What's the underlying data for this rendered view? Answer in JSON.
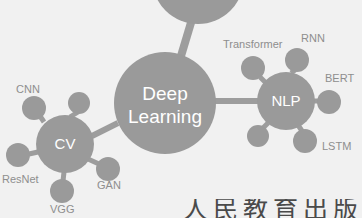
{
  "diagram": {
    "type": "node-link-graph",
    "background_color": "#f1f1f1",
    "node_color": "#9a9a9a",
    "node_label_color": "#ffffff",
    "leaf_label_color": "#8e8e8e",
    "edge_color": "#9d9d9d",
    "root": {
      "name": "partial-node-top",
      "label": "",
      "cx": 198,
      "cy": -22,
      "r": 46,
      "clipped": true
    },
    "hubs": [
      {
        "id": "deep-learning",
        "label_line1": "Deep",
        "label_line2": "Learning",
        "cx": 165,
        "cy": 103,
        "r": 51
      },
      {
        "id": "cv",
        "label_line1": "CV",
        "label_line2": "",
        "cx": 65,
        "cy": 144,
        "r": 29
      },
      {
        "id": "nlp",
        "label_line1": "NLP",
        "label_line2": "",
        "cx": 286,
        "cy": 101,
        "r": 29
      }
    ],
    "leaves": [
      {
        "id": "cnn",
        "label": "CNN",
        "parent": "cv",
        "cx": 34,
        "cy": 108,
        "r": 12,
        "lx": 16,
        "ly": 90,
        "anchor": "start"
      },
      {
        "id": "cv-top",
        "label": "",
        "parent": "cv",
        "cx": 79,
        "cy": 103,
        "r": 11,
        "lx": 0,
        "ly": 0,
        "anchor": "start"
      },
      {
        "id": "resnet",
        "label": "ResNet",
        "parent": "cv",
        "cx": 18,
        "cy": 155,
        "r": 12,
        "lx": 2,
        "ly": 180,
        "anchor": "start"
      },
      {
        "id": "vgg",
        "label": "VGG",
        "parent": "cv",
        "cx": 62,
        "cy": 191,
        "r": 12,
        "lx": 50,
        "ly": 210,
        "anchor": "start"
      },
      {
        "id": "gan",
        "label": "GAN",
        "parent": "cv",
        "cx": 108,
        "cy": 169,
        "r": 12,
        "lx": 97,
        "ly": 186,
        "anchor": "start"
      },
      {
        "id": "transformer",
        "label": "Transformer",
        "parent": "nlp",
        "cx": 253,
        "cy": 68,
        "r": 12,
        "lx": 223,
        "ly": 45,
        "anchor": "start"
      },
      {
        "id": "rnn",
        "label": "RNN",
        "parent": "nlp",
        "cx": 297,
        "cy": 60,
        "r": 12,
        "lx": 301,
        "ly": 39,
        "anchor": "start"
      },
      {
        "id": "bert",
        "label": "BERT",
        "parent": "nlp",
        "cx": 329,
        "cy": 102,
        "r": 12,
        "lx": 325,
        "ly": 79,
        "anchor": "start"
      },
      {
        "id": "lstm",
        "label": "LSTM",
        "parent": "nlp",
        "cx": 305,
        "cy": 141,
        "r": 12,
        "lx": 322,
        "ly": 147,
        "anchor": "start"
      },
      {
        "id": "nlp-bottom",
        "label": "",
        "parent": "nlp",
        "cx": 258,
        "cy": 136,
        "r": 11,
        "lx": 0,
        "ly": 0,
        "anchor": "start"
      }
    ],
    "edges": [
      {
        "id": "edge-root-dl",
        "x1": 193,
        "y1": 16,
        "x2": 181,
        "y2": 56,
        "width": 8
      },
      {
        "id": "edge-dl-cv",
        "x1": 118,
        "y1": 123,
        "x2": 92,
        "y2": 136,
        "width": 6
      },
      {
        "id": "edge-dl-nlp",
        "x1": 215,
        "y1": 101,
        "x2": 258,
        "y2": 101,
        "width": 6
      },
      {
        "id": "edge-cv-cnn",
        "x1": 44,
        "y1": 120,
        "x2": 40,
        "y2": 116,
        "width": 5
      },
      {
        "id": "edge-cv-top",
        "x1": 71,
        "y1": 117,
        "x2": 77,
        "y2": 113,
        "width": 5
      },
      {
        "id": "edge-cv-resnet",
        "x1": 38,
        "y1": 152,
        "x2": 29,
        "y2": 154,
        "width": 5
      },
      {
        "id": "edge-cv-vgg",
        "x1": 64,
        "y1": 173,
        "x2": 63,
        "y2": 180,
        "width": 5
      },
      {
        "id": "edge-cv-gan",
        "x1": 88,
        "y1": 159,
        "x2": 98,
        "y2": 164,
        "width": 5
      },
      {
        "id": "edge-nlp-transformer",
        "x1": 266,
        "y1": 83,
        "x2": 260,
        "y2": 77,
        "width": 5
      },
      {
        "id": "edge-nlp-rnn",
        "x1": 291,
        "y1": 73,
        "x2": 295,
        "y2": 70,
        "width": 5
      },
      {
        "id": "edge-nlp-bert",
        "x1": 314,
        "y1": 101,
        "x2": 319,
        "y2": 101,
        "width": 5
      },
      {
        "id": "edge-nlp-lstm",
        "x1": 299,
        "y1": 125,
        "x2": 302,
        "y2": 131,
        "width": 5
      },
      {
        "id": "edge-nlp-bottom",
        "x1": 268,
        "y1": 123,
        "x2": 263,
        "y2": 128,
        "width": 5
      }
    ]
  },
  "footer": {
    "cropped_text": "人民教育出版"
  }
}
